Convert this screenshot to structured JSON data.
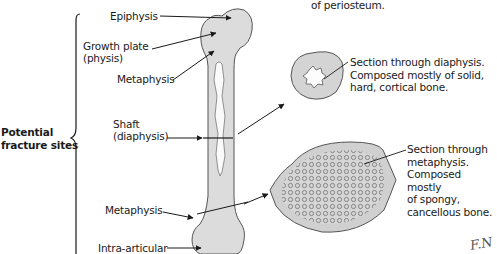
{
  "diagram": {
    "type": "anatomical-illustration",
    "bracket_label": {
      "line1": "Potential",
      "line2": "fracture sites"
    },
    "bone_labels": [
      {
        "id": "epiphysis",
        "text": "Epiphysis"
      },
      {
        "id": "growth-plate",
        "line1": "Growth plate",
        "line2": "(physis)"
      },
      {
        "id": "metaphysis-upper",
        "text": "Metaphysis"
      },
      {
        "id": "shaft",
        "line1": "Shaft",
        "line2": "(diaphysis)"
      },
      {
        "id": "metaphysis-lower",
        "text": "Metaphysis"
      },
      {
        "id": "intra-articular",
        "text": "Intra-articular"
      }
    ],
    "top_caption_fragment": "of periosteum.",
    "sections": [
      {
        "id": "diaphysis-section",
        "line1": "Section through diaphysis.",
        "line2": "Composed mostly of solid,",
        "line3": "hard, cortical bone."
      },
      {
        "id": "metaphysis-section",
        "line1": "Section through",
        "line2": "metaphysis.",
        "line3": "Composed mostly",
        "line4": "of spongy,",
        "line5": "cancellous bone."
      }
    ],
    "signature": "F. Netter",
    "colors": {
      "bone_fill": "#d9d9d9",
      "outline": "#555555",
      "text": "#1a1a1a",
      "spongy_fill": "#c8c8c8"
    }
  }
}
